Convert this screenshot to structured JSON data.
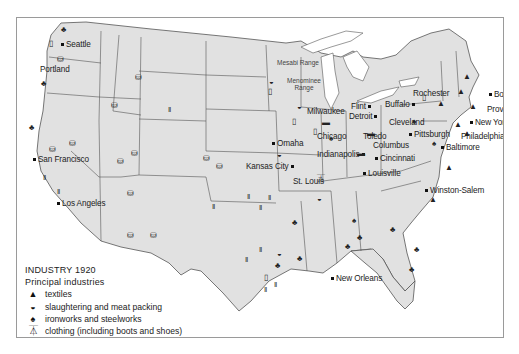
{
  "map": {
    "title": "INDUSTRY 1920",
    "subtitle": "Principal industries",
    "colors": {
      "land": "#e1e1e1",
      "water": "#ffffff",
      "borders": "#555555",
      "symbols": "#1a1a1a"
    },
    "legend": [
      {
        "icon": "textiles-icon",
        "glyph": "▲",
        "label": "textiles"
      },
      {
        "icon": "slaughtering-icon",
        "glyph": "◒",
        "label": "slaughtering and meat packing"
      },
      {
        "icon": "ironworks-icon",
        "glyph": "♠",
        "label": "ironworks and steelworks"
      },
      {
        "icon": "clothing-icon",
        "glyph": "⏄",
        "label": "clothing (including boots and shoes)"
      },
      {
        "icon": "automobile-icon",
        "glyph": "▬",
        "label": "automobiles and parts"
      },
      {
        "icon": "flour-icon",
        "glyph": "▯",
        "label": "flour and meal"
      },
      {
        "icon": "lumber-icon",
        "glyph": "♣",
        "label": "lumber and timber"
      },
      {
        "icon": "mining-icon",
        "glyph": "⛁ ‖",
        "label": "mining, gas, and oil"
      }
    ],
    "cities": [
      {
        "name": "Seattle"
      },
      {
        "name": "Portland"
      },
      {
        "name": "San Francisco"
      },
      {
        "name": "Los Angeles"
      },
      {
        "name": "Omaha"
      },
      {
        "name": "Kansas City"
      },
      {
        "name": "St. Louis"
      },
      {
        "name": "Milwaukee"
      },
      {
        "name": "Chicago"
      },
      {
        "name": "Indianapolis"
      },
      {
        "name": "Flint"
      },
      {
        "name": "Detroit"
      },
      {
        "name": "Toledo"
      },
      {
        "name": "Cleveland"
      },
      {
        "name": "Columbus"
      },
      {
        "name": "Cincinnati"
      },
      {
        "name": "Louisville"
      },
      {
        "name": "Buffalo"
      },
      {
        "name": "Rochester"
      },
      {
        "name": "Pittsburgh"
      },
      {
        "name": "Boston"
      },
      {
        "name": "Providence"
      },
      {
        "name": "New York"
      },
      {
        "name": "Philadelphia"
      },
      {
        "name": "Baltimore"
      },
      {
        "name": "Winston-Salem"
      },
      {
        "name": "New Orleans"
      }
    ],
    "regions": [
      {
        "name": "Mesabi Range"
      },
      {
        "name": "Menominee Range"
      }
    ]
  }
}
